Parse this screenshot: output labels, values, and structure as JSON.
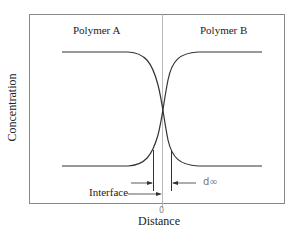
{
  "diagram": {
    "labels": {
      "polymer_a": "Polymer A",
      "polymer_b": "Polymer B",
      "y_axis": "Concentration",
      "x_axis": "Distance",
      "origin": "0",
      "interface": "Interface",
      "d_inf": "d∞"
    },
    "colors": {
      "line": "#333333",
      "frame": "#888888",
      "center": "#aaaaaa"
    }
  }
}
